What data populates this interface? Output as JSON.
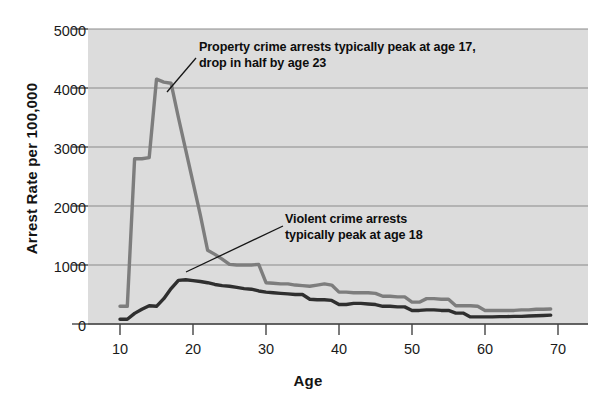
{
  "chart_data": {
    "type": "line",
    "title": "",
    "xlabel": "Age",
    "ylabel": "Arrest Rate per 100,000",
    "xlim": [
      10,
      70
    ],
    "ylim": [
      0,
      5000
    ],
    "xticks": [
      10,
      20,
      30,
      40,
      50,
      60,
      70
    ],
    "yticks": [
      0,
      1000,
      2000,
      3000,
      4000,
      5000
    ],
    "grid": "horizontal",
    "legend": "none",
    "plot_background": "#dcdcdc",
    "series": [
      {
        "name": "Property crime arrests",
        "color": "#7d7d7d",
        "x": [
          10,
          11,
          12,
          13,
          14,
          15,
          16,
          17,
          18,
          19,
          20,
          21,
          22,
          23,
          24,
          25,
          26,
          27,
          28,
          29,
          30,
          31,
          32,
          33,
          34,
          35,
          36,
          37,
          38,
          39,
          40,
          41,
          42,
          43,
          44,
          45,
          46,
          47,
          48,
          49,
          50,
          51,
          52,
          53,
          54,
          55,
          56,
          57,
          58,
          59,
          60,
          61,
          62,
          63,
          64,
          65,
          66,
          67,
          68,
          69
        ],
        "values": [
          300,
          300,
          2800,
          2800,
          2820,
          4150,
          4100,
          4080,
          3500,
          2950,
          2400,
          1850,
          1250,
          1180,
          1100,
          1010,
          1000,
          1000,
          1000,
          1010,
          700,
          690,
          680,
          680,
          660,
          650,
          640,
          660,
          680,
          660,
          540,
          540,
          530,
          530,
          530,
          520,
          470,
          470,
          460,
          460,
          370,
          370,
          430,
          430,
          420,
          420,
          310,
          310,
          310,
          300,
          230,
          230,
          230,
          230,
          230,
          240,
          240,
          250,
          250,
          255
        ]
      },
      {
        "name": "Violent crime arrests",
        "color": "#2f2f2f",
        "x": [
          10,
          11,
          12,
          13,
          14,
          15,
          16,
          17,
          18,
          19,
          20,
          21,
          22,
          23,
          24,
          25,
          26,
          27,
          28,
          29,
          30,
          31,
          32,
          33,
          34,
          35,
          36,
          37,
          38,
          39,
          40,
          41,
          42,
          43,
          44,
          45,
          46,
          47,
          48,
          49,
          50,
          51,
          52,
          53,
          54,
          55,
          56,
          57,
          58,
          59,
          60,
          61,
          62,
          63,
          64,
          65,
          66,
          67,
          68,
          69
        ],
        "values": [
          80,
          80,
          180,
          250,
          310,
          300,
          430,
          600,
          740,
          750,
          735,
          720,
          700,
          670,
          650,
          640,
          620,
          600,
          590,
          560,
          540,
          530,
          520,
          510,
          500,
          500,
          420,
          410,
          410,
          400,
          330,
          330,
          350,
          350,
          340,
          330,
          300,
          300,
          290,
          290,
          230,
          230,
          240,
          240,
          230,
          230,
          185,
          185,
          120,
          120,
          120,
          120,
          125,
          125,
          130,
          130,
          135,
          140,
          145,
          150
        ]
      }
    ],
    "annotations": [
      {
        "id": "property",
        "text": "Property crime arrests typically peak at age 17,\ndrop in half by age 23",
        "leader_from": [
          196,
          58
        ],
        "leader_to": [
          167,
          92
        ]
      },
      {
        "id": "violent",
        "text": "Violent crime arrests\ntypically peak at age 18",
        "leader_from": [
          283,
          226
        ],
        "leader_to": [
          186,
          272
        ]
      }
    ]
  },
  "axes": {
    "y_title": "Arrest Rate per 100,000",
    "x_title": "Age",
    "y_tick_labels": [
      "5000",
      "4000",
      "3000",
      "2000",
      "1000",
      "0"
    ],
    "x_tick_labels": [
      "10",
      "20",
      "30",
      "40",
      "50",
      "60",
      "70"
    ]
  },
  "annotations": {
    "property": "Property crime arrests typically peak at age 17,\ndrop in half by age 23",
    "violent": "Violent crime arrests\ntypically peak at age 18"
  },
  "colors": {
    "property_line": "#7d7d7d",
    "violent_line": "#2f2f2f",
    "plot_bg": "#dcdcdc",
    "grid": "#8a8a8a",
    "axis": "#444444",
    "page_bg": "#ffffff",
    "text": "#111111"
  }
}
